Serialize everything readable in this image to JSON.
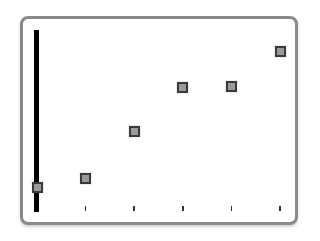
{
  "chart_data": {
    "type": "scatter",
    "title": "",
    "xlabel": "",
    "ylabel": "",
    "x": [
      0,
      1,
      2,
      3,
      4,
      5
    ],
    "values": [
      1.3,
      1.8,
      4.4,
      6.8,
      6.9,
      8.8
    ],
    "series": [
      {
        "name": "series-1",
        "x": [
          0,
          1,
          2,
          3,
          4,
          5
        ],
        "values": [
          1.3,
          1.8,
          4.4,
          6.8,
          6.9,
          8.8
        ]
      }
    ],
    "ylim": [
      0,
      10
    ],
    "xlim": [
      0,
      5
    ],
    "x_ticks": [
      1,
      2,
      3,
      4,
      5
    ],
    "tick_labels": [],
    "grid": false,
    "legend": null,
    "marker": "square",
    "marker_color": "#9a9a9a",
    "marker_edge_color": "#3a3a3a",
    "frame_color": "#8a8a8a",
    "yaxis_color": "#000000"
  }
}
